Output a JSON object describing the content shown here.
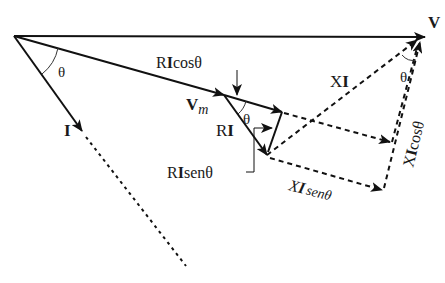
{
  "diagram": {
    "labels": {
      "V": "V",
      "Vm_main": "V",
      "Vm_sub": "m",
      "I": "I",
      "theta_origin": "θ",
      "theta_RI": "θ",
      "theta_V": "θ",
      "RIcos_R": "R",
      "RIcos_I": "I",
      "RIcos_rest": "cosθ",
      "RI_R": "R",
      "RI_I": "I",
      "RIsen_R": "R",
      "RIsen_I": "I",
      "RIsen_rest": "senθ",
      "XI_X": "X",
      "XI_I": "I",
      "XIsen_X": "X",
      "XIsen_I": "I",
      "XIsen_rest": "senθ",
      "XIcos_X": "X",
      "XIcos_I": "I",
      "XIcos_rest": "cosθ"
    },
    "colors": {
      "stroke": "#111111"
    }
  }
}
